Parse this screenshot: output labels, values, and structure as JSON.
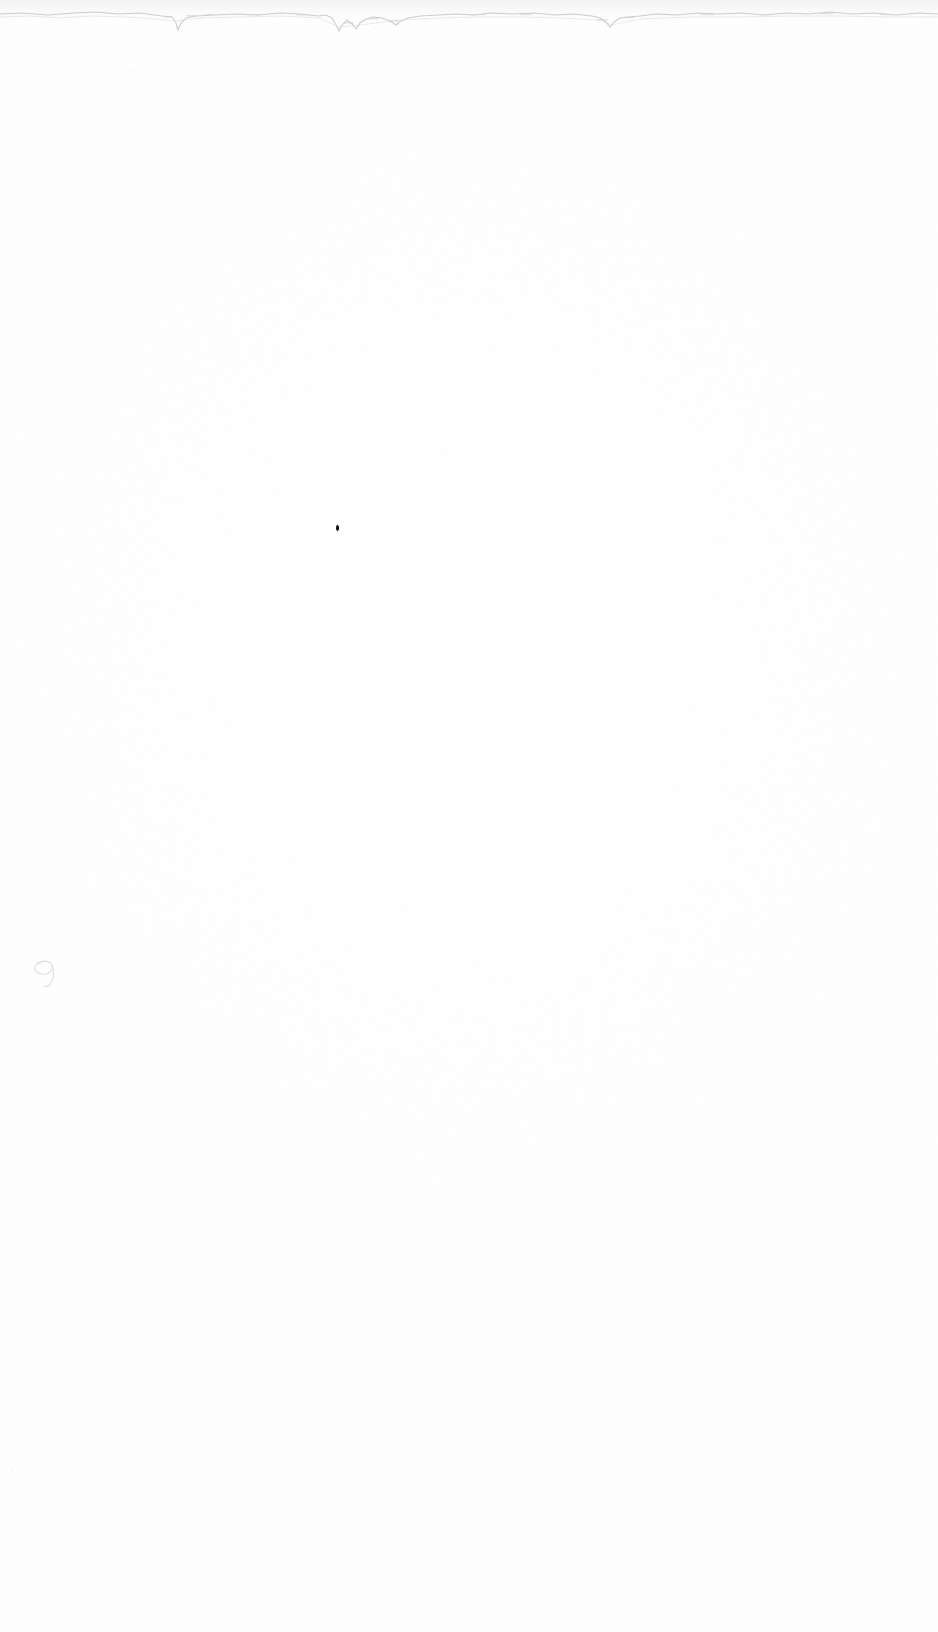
{
  "document": {
    "kind": "scanned-page",
    "description": "Blank scanned sheet of paper",
    "page_width": 938,
    "page_height": 1632,
    "background_color": "#ffffff",
    "text_content": "",
    "visible_text_count": 0
  },
  "artifacts": {
    "top_edge": {
      "name": "torn-paper-edge",
      "description": "Ragged horizontal scan boundary along the top of the sheet",
      "color": "#c8c8c8",
      "top": 4,
      "height": 40
    },
    "ink_speck": {
      "name": "ink-speck",
      "description": "Small dark ink dot near upper-middle of page",
      "color": "#14120f",
      "x": 336,
      "y": 525,
      "width": 3,
      "height": 6
    },
    "loop_mark": {
      "name": "pencil-loop-mark",
      "description": "Faint handwritten loop resembling a cursive nine at the left margin",
      "color": "#dcdcdc",
      "x": 31,
      "y": 956,
      "width": 30,
      "height": 34
    },
    "minor_specks": [
      {
        "x": 132,
        "y": 70,
        "size": 2,
        "color": "#f4f4f4"
      },
      {
        "x": 443,
        "y": 455,
        "size": 2,
        "color": "#f5f5f5"
      },
      {
        "x": 793,
        "y": 1125,
        "size": 2,
        "color": "#f6f6f6"
      },
      {
        "x": 11,
        "y": 1470,
        "size": 2,
        "color": "#f3f3f3"
      },
      {
        "x": 666,
        "y": 1491,
        "size": 2,
        "color": "#f6f6f6"
      }
    ]
  }
}
